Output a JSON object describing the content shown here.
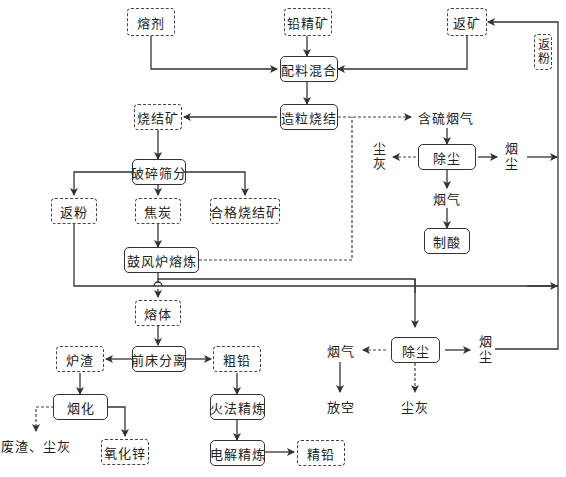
{
  "nodes": {
    "flux": "熔剂",
    "lead_concentrate": "铅精矿",
    "return_ore": "返矿",
    "return_powder_top": "返粉",
    "batching_mixing": "配料混合",
    "pelletizing_sintering": "造粒烧结",
    "sinter": "烧结矿",
    "sulfur_flue_gas": "含硫烟气",
    "dust_removal_1": "除尘",
    "dust_ash_1": "尘灰",
    "fume_dust_1": "烟尘",
    "flue_gas_1": "烟气",
    "acid_making": "制酸",
    "crushing_screening": "破碎筛分",
    "return_powder": "返粉",
    "coke": "焦炭",
    "qualified_sinter": "合格烧结矿",
    "blast_furnace_smelting": "鼓风炉熔炼",
    "melt": "熔体",
    "forehearth_separation": "前床分离",
    "furnace_slag": "炉渣",
    "crude_lead": "粗铅",
    "fuming": "烟化",
    "waste_slag_dust": "废渣、尘灰",
    "zinc_oxide": "氧化锌",
    "fire_refining": "火法精炼",
    "electrolytic_refining": "电解精炼",
    "refined_lead": "精铅",
    "dust_removal_2": "除尘",
    "flue_gas_2": "烟气",
    "vent": "放空",
    "dust_ash_2": "尘灰",
    "fume_dust_2": "烟尘"
  },
  "colors": {
    "line": "#333333",
    "background": "#ffffff"
  }
}
